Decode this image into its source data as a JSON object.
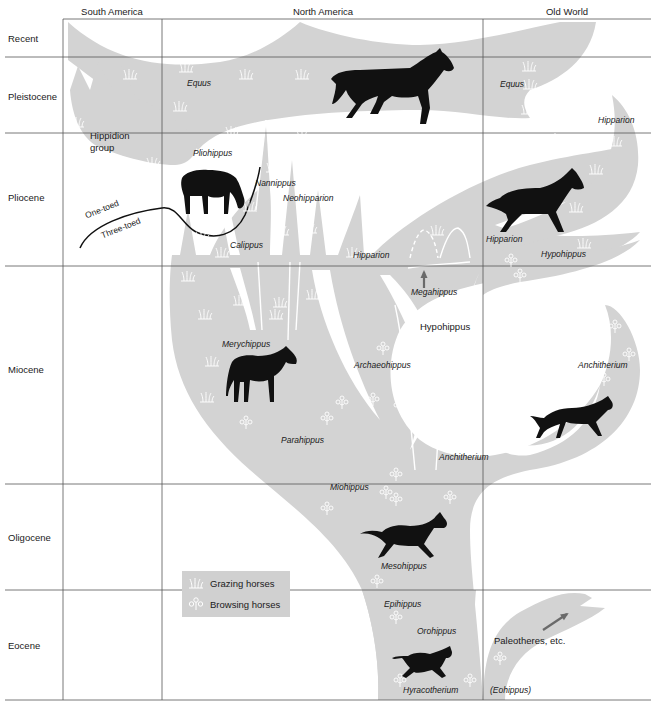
{
  "columns": [
    {
      "label": "South America",
      "center_x": 112
    },
    {
      "label": "North America",
      "center_x": 323
    },
    {
      "label": "Old World",
      "center_x": 567
    }
  ],
  "epochs": [
    {
      "label": "Recent",
      "center_y": 38
    },
    {
      "label": "Pleistocene",
      "center_y": 96
    },
    {
      "label": "Pliocene",
      "center_y": 197
    },
    {
      "label": "Miocene",
      "center_y": 369
    },
    {
      "label": "Oligocene",
      "center_y": 537
    },
    {
      "label": "Eocene",
      "center_y": 645
    }
  ],
  "grid": {
    "col_lines_x": [
      63,
      162,
      483
    ],
    "row_lines_y": [
      19,
      57,
      133,
      266,
      484,
      590,
      700
    ],
    "left": 5,
    "right": 651
  },
  "colors": {
    "fill": "#d3d3d3",
    "grid": "#555555",
    "silhouette": "#111111",
    "arrow": "#6a6a6a",
    "icon": "#ffffff"
  },
  "taxa": [
    {
      "id": "equus-na",
      "text": "Equus",
      "italic": true,
      "x": 187,
      "y": 84
    },
    {
      "id": "equus-ow",
      "text": "Equus",
      "italic": true,
      "x": 500,
      "y": 85
    },
    {
      "id": "hipparion-ow-top",
      "text": "Hipparion",
      "italic": true,
      "x": 598,
      "y": 121
    },
    {
      "id": "hippidion",
      "text": "Hippidion",
      "italic": false,
      "x": 90,
      "y": 136
    },
    {
      "id": "hippidion-group",
      "text": "group",
      "italic": false,
      "x": 90,
      "y": 148
    },
    {
      "id": "pliohippus",
      "text": "Pliohippus",
      "italic": true,
      "x": 193,
      "y": 154
    },
    {
      "id": "nannippus",
      "text": "Nannippus",
      "italic": true,
      "x": 255,
      "y": 184
    },
    {
      "id": "neohipparion",
      "text": "Neohipparion",
      "italic": true,
      "x": 283,
      "y": 199
    },
    {
      "id": "calippus",
      "text": "Calippus",
      "italic": true,
      "x": 230,
      "y": 246
    },
    {
      "id": "hipparion-na",
      "text": "Hipparion",
      "italic": true,
      "x": 353,
      "y": 256
    },
    {
      "id": "hipparion-ow-mid",
      "text": "Hipparion",
      "italic": true,
      "x": 486,
      "y": 240
    },
    {
      "id": "hypohippus-ow",
      "text": "Hypohippus",
      "italic": true,
      "x": 541,
      "y": 255
    },
    {
      "id": "megahippus",
      "text": "Megahippus",
      "italic": true,
      "x": 411,
      "y": 293
    },
    {
      "id": "hypohippus-na",
      "text": "Hypohippus",
      "italic": false,
      "x": 420,
      "y": 327
    },
    {
      "id": "merychippus",
      "text": "Merychippus",
      "italic": true,
      "x": 222,
      "y": 345
    },
    {
      "id": "archaeohippus",
      "text": "Archaeohippus",
      "italic": true,
      "x": 354,
      "y": 366
    },
    {
      "id": "anchitherium-ow",
      "text": "Anchitherium",
      "italic": true,
      "x": 578,
      "y": 366
    },
    {
      "id": "parahippus",
      "text": "Parahippus",
      "italic": true,
      "x": 281,
      "y": 441
    },
    {
      "id": "anchitherium-na",
      "text": "Anchitherium",
      "italic": true,
      "x": 439,
      "y": 458
    },
    {
      "id": "miohippus",
      "text": "Miohippus",
      "italic": true,
      "x": 330,
      "y": 488
    },
    {
      "id": "mesohippus",
      "text": "Mesohippus",
      "italic": true,
      "x": 381,
      "y": 567
    },
    {
      "id": "epihippus",
      "text": "Epihippus",
      "italic": true,
      "x": 384,
      "y": 605
    },
    {
      "id": "orohippus",
      "text": "Orohippus",
      "italic": true,
      "x": 417,
      "y": 632
    },
    {
      "id": "paleotheres",
      "text": "Paleotheres, etc.",
      "italic": false,
      "x": 494,
      "y": 641
    },
    {
      "id": "hyracotherium",
      "text": "Hyracotherium",
      "italic": true,
      "x": 403,
      "y": 691
    },
    {
      "id": "eohippus",
      "text": "(Eohippus)",
      "italic": true,
      "x": 490,
      "y": 691
    }
  ],
  "toe_boundary": {
    "upper_label": "One-toed",
    "lower_label": "Three-toed"
  },
  "legend": {
    "items": [
      {
        "icon": "grass-icon",
        "label": "Grazing horses"
      },
      {
        "icon": "shrub-icon",
        "label": "Browsing horses"
      }
    ]
  },
  "grazing_icons": [
    [
      130,
      74
    ],
    [
      186,
      67
    ],
    [
      246,
      74
    ],
    [
      302,
      74
    ],
    [
      180,
      106
    ],
    [
      77,
      122
    ],
    [
      232,
      131
    ],
    [
      153,
      162
    ],
    [
      303,
      135
    ],
    [
      419,
      143
    ],
    [
      529,
      66
    ],
    [
      528,
      109
    ],
    [
      530,
      84
    ],
    [
      556,
      138
    ],
    [
      615,
      141
    ],
    [
      596,
      169
    ],
    [
      576,
      207
    ],
    [
      200,
      205
    ],
    [
      250,
      206
    ],
    [
      273,
      167
    ],
    [
      310,
      228
    ],
    [
      282,
      230
    ],
    [
      202,
      236
    ],
    [
      123,
      244
    ],
    [
      353,
      252
    ],
    [
      280,
      302
    ],
    [
      313,
      294
    ],
    [
      437,
      230
    ],
    [
      205,
      314
    ],
    [
      240,
      300
    ],
    [
      212,
      361
    ],
    [
      276,
      314
    ],
    [
      207,
      397
    ],
    [
      378,
      237
    ],
    [
      320,
      170
    ],
    [
      584,
      243
    ],
    [
      188,
      276
    ],
    [
      222,
      252
    ]
  ],
  "browsing_icons": [
    [
      246,
      423
    ],
    [
      327,
      419
    ],
    [
      383,
      349
    ],
    [
      438,
      364
    ],
    [
      396,
      475
    ],
    [
      400,
      406
    ],
    [
      431,
      408
    ],
    [
      463,
      434
    ],
    [
      461,
      407
    ],
    [
      342,
      403
    ],
    [
      520,
      276
    ],
    [
      615,
      327
    ],
    [
      629,
      355
    ],
    [
      604,
      380
    ],
    [
      519,
      447
    ],
    [
      386,
      493
    ],
    [
      396,
      500
    ],
    [
      450,
      498
    ],
    [
      327,
      509
    ],
    [
      377,
      582
    ],
    [
      396,
      618
    ],
    [
      345,
      621
    ],
    [
      500,
      659
    ],
    [
      400,
      681
    ],
    [
      470,
      681
    ],
    [
      511,
      261
    ],
    [
      437,
      308
    ],
    [
      230,
      590
    ],
    [
      373,
      400
    ]
  ],
  "arrows": [
    {
      "id": "megahippus-arrow",
      "x1": 424,
      "y1": 288,
      "x2": 424,
      "y2": 272
    },
    {
      "id": "paleotheres-arrow",
      "x1": 543,
      "y1": 630,
      "x2": 567,
      "y2": 614
    }
  ]
}
